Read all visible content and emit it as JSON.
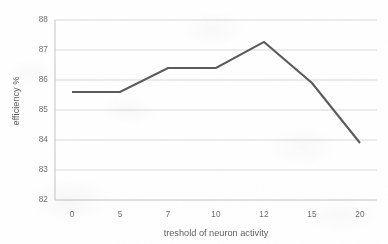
{
  "chart_data": {
    "type": "line",
    "title": "",
    "xlabel": "treshold of neuron activity",
    "ylabel": "efficiency %",
    "categories": [
      "0",
      "5",
      "7",
      "10",
      "12",
      "15",
      "20"
    ],
    "x": [
      0,
      5,
      7,
      10,
      12,
      15,
      20
    ],
    "values": [
      85.6,
      85.6,
      86.4,
      86.4,
      87.27,
      85.9,
      83.9
    ],
    "series": [
      {
        "name": "efficiency",
        "values": [
          85.6,
          85.6,
          86.4,
          86.4,
          87.27,
          85.9,
          83.9
        ]
      }
    ],
    "ylim": [
      82,
      88
    ],
    "yticks": [
      82,
      83,
      84,
      85,
      86,
      87,
      88
    ],
    "ytick_labels": [
      "82",
      "83",
      "84",
      "85",
      "86",
      "87",
      "88"
    ],
    "xtick_labels": [
      "0",
      "5",
      "7",
      "10",
      "12",
      "15",
      "20"
    ],
    "grid": "horizontal",
    "legend": "none",
    "markers": false,
    "line_color": "#595959",
    "grid_color": "#d9d9d9",
    "axis_color": "#bfbfbf",
    "text_color": "#6d6d6d",
    "background": "#ffffff"
  },
  "axes": {
    "y_title": "efficiency %",
    "x_title": "treshold of neuron activity"
  }
}
